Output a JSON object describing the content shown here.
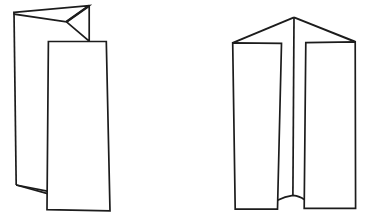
{
  "page": {
    "width": 370,
    "height": 223,
    "background": "#ffffff"
  },
  "drawing": {
    "ink_color": "#1c1c1c",
    "paper_color": "#ffffff",
    "stroke_width": 1.7
  },
  "figures": [
    {
      "name": "left-folded-paper",
      "label": "z-folded-sheet-standing",
      "shapes": [
        {
          "kind": "polyline",
          "name": "outer-panel-left-edge",
          "points": [
            [
              14,
              12.3
            ],
            [
              16.2,
              185
            ]
          ]
        },
        {
          "kind": "polyline",
          "name": "bottom-fold-upper-edge",
          "points": [
            [
              16.2,
              185
            ],
            [
              47.2,
              191.2
            ]
          ]
        },
        {
          "kind": "polyline",
          "name": "bottom-fold-lower-edge",
          "points": [
            [
              16.2,
              185
            ],
            [
              47.6,
              193.6
            ]
          ]
        },
        {
          "kind": "polygon",
          "name": "top-flap-wedge",
          "fill": true,
          "points": [
            [
              14,
              12.3
            ],
            [
              89.2,
              5.7
            ],
            [
              66.5,
              21.8
            ],
            [
              14.4,
              14.2
            ]
          ]
        },
        {
          "kind": "polyline",
          "name": "top-fold-notch-to-front",
          "points": [
            [
              89.2,
              5.7
            ],
            [
              89.2,
              41.2
            ],
            [
              66.5,
              21.8
            ]
          ]
        },
        {
          "kind": "polyline",
          "name": "top-fold-crease-bold",
          "w": 2.3,
          "points": [
            [
              89.2,
              5.7
            ],
            [
              66.5,
              21.8
            ]
          ]
        },
        {
          "kind": "polygon",
          "name": "front-panel",
          "fill": true,
          "points": [
            [
              48.4,
              41.5
            ],
            [
              106.3,
              41.5
            ],
            [
              110,
              210.8
            ],
            [
              47,
              209.6
            ]
          ]
        }
      ]
    },
    {
      "name": "right-folded-paper",
      "label": "gate-folded-sheet-standing",
      "shapes": [
        {
          "kind": "polyline",
          "name": "left-roof-edge",
          "w": 2.0,
          "points": [
            [
              294,
              17.4
            ],
            [
              232.7,
              42.8
            ]
          ]
        },
        {
          "kind": "polyline",
          "name": "right-roof-edge",
          "w": 2.0,
          "points": [
            [
              294,
              17.4
            ],
            [
              355.2,
              41.8
            ]
          ]
        },
        {
          "kind": "polyline",
          "name": "center-crease",
          "points": [
            [
              294,
              17.4
            ],
            [
              292.9,
              195.3
            ]
          ]
        },
        {
          "kind": "path",
          "name": "bottom-fold-curve",
          "d": "M 277.5 200.2 Q 285 196.3 292.9 195.3 Q 300 196.2 304.2 199.5"
        },
        {
          "kind": "polygon",
          "name": "left-front-panel",
          "fill": true,
          "points": [
            [
              232.7,
              42.8
            ],
            [
              281.5,
              43.4
            ],
            [
              277.5,
              209.2
            ],
            [
              235.2,
              209.2
            ]
          ]
        },
        {
          "kind": "polygon",
          "name": "right-front-panel",
          "fill": true,
          "points": [
            [
              305.8,
              42.6
            ],
            [
              355.2,
              41.8
            ],
            [
              355.6,
              208.4
            ],
            [
              304.2,
              208.4
            ]
          ]
        }
      ]
    }
  ]
}
